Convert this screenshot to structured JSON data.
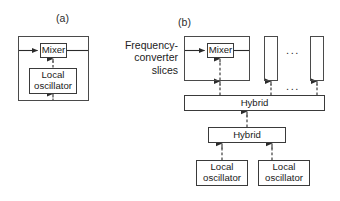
{
  "figure": {
    "type": "block-diagram",
    "caption_panels": [
      "(a)",
      "(b)"
    ],
    "colors": {
      "stroke": "#3a3a3a",
      "text": "#1a1a1a",
      "background": "#ffffff"
    }
  },
  "panel_a": {
    "label": "(a)",
    "blocks": [
      {
        "name": "frequency-converter-slice",
        "text": ""
      },
      {
        "name": "mixer",
        "text": "Mixer"
      },
      {
        "name": "local-oscillator",
        "text": "Local\noscillator"
      }
    ],
    "connections": [
      {
        "from": "input-port",
        "to": "mixer",
        "style": "solid",
        "label": ""
      },
      {
        "from": "mixer",
        "to": "output-port",
        "style": "solid",
        "label": ""
      },
      {
        "from": "local-oscillator",
        "to": "mixer",
        "style": "dashed",
        "label": ""
      },
      {
        "from": "external-lo-input",
        "to": "local-oscillator",
        "style": "dashed",
        "label": ""
      }
    ]
  },
  "panel_b": {
    "label": "(b)",
    "group_label": "Frequency-\nconverter\nslices",
    "blocks": [
      {
        "name": "frequency-converter-slice-1",
        "text": ""
      },
      {
        "name": "mixer",
        "text": "Mixer"
      },
      {
        "name": "frequency-converter-slice-2",
        "text": ""
      },
      {
        "name": "frequency-converter-slice-n",
        "text": ""
      },
      {
        "name": "hybrid-top",
        "text": "Hybrid"
      },
      {
        "name": "hybrid-bottom",
        "text": "Hybrid"
      },
      {
        "name": "local-oscillator-left",
        "text": "Local\noscillator"
      },
      {
        "name": "local-oscillator-right",
        "text": "Local\noscillator"
      }
    ],
    "ellipsis": "• • •",
    "ellipsis_top": "...",
    "ellipsis_mid": "...",
    "connections": [
      {
        "from": "input-port",
        "to": "mixer",
        "style": "solid",
        "label": ""
      },
      {
        "from": "mixer",
        "to": "output-port",
        "style": "solid",
        "label": ""
      },
      {
        "from": "hybrid-top",
        "to": "slice-1",
        "style": "dashed",
        "label": ""
      },
      {
        "from": "hybrid-top",
        "to": "slice-2",
        "style": "dashed",
        "label": ""
      },
      {
        "from": "hybrid-top",
        "to": "slice-n",
        "style": "dashed",
        "label": ""
      },
      {
        "from": "hybrid-bottom",
        "to": "hybrid-top",
        "style": "dashed",
        "label": ""
      },
      {
        "from": "local-oscillator-left",
        "to": "hybrid-bottom",
        "style": "dashed",
        "label": ""
      },
      {
        "from": "local-oscillator-right",
        "to": "hybrid-bottom",
        "style": "dashed",
        "label": ""
      }
    ]
  }
}
